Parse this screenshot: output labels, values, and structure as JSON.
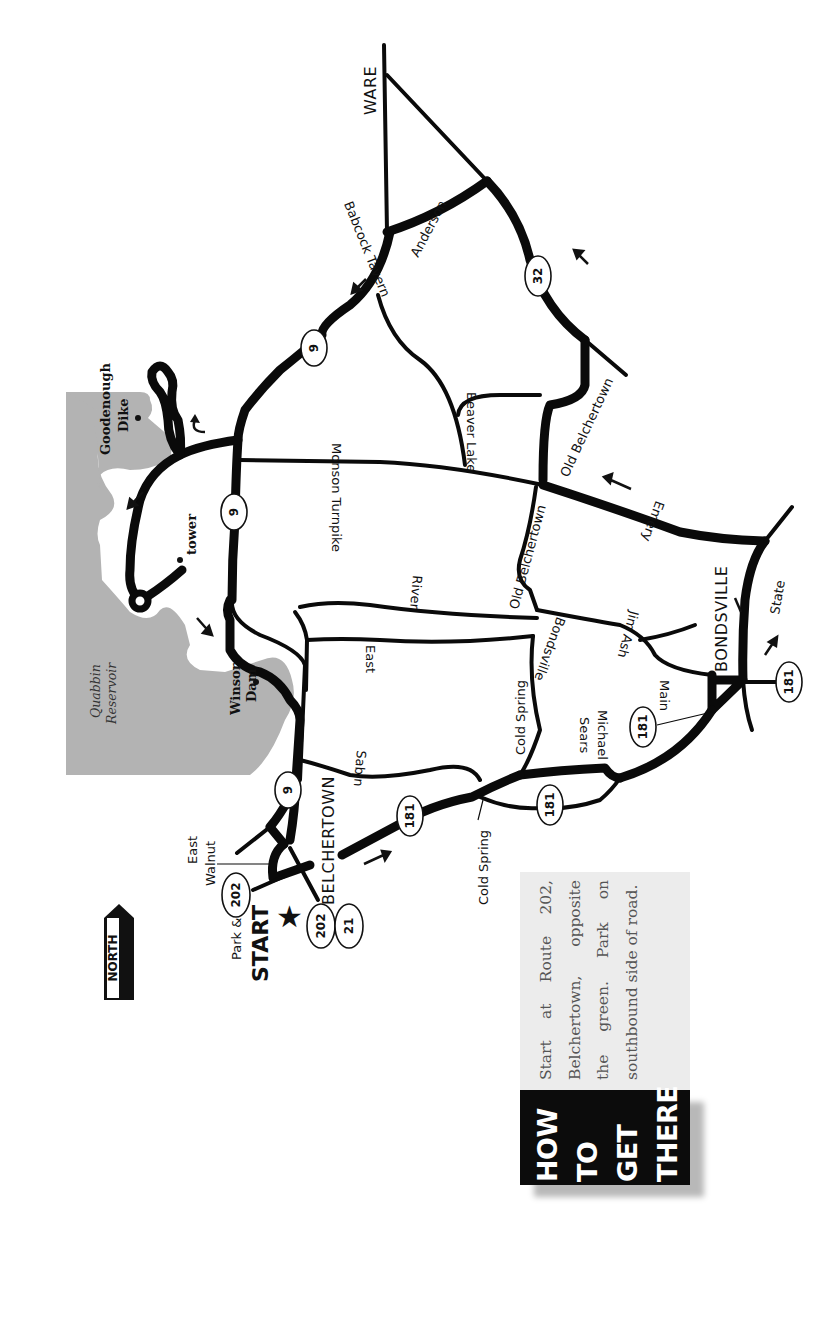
{
  "map": {
    "title": "How to get there route map",
    "north_label": "NORTH",
    "water": {
      "reservoir_label_line1": "Quabbin",
      "reservoir_label_line2": "Reservoir"
    },
    "landmarks": {
      "goodenough_line1": "Goodenough",
      "goodenough_line2": "Dike",
      "tower": "tower",
      "winsor_line1": "Winsor",
      "winsor_line2": "Dam"
    },
    "towns": {
      "ware": "WARE",
      "belchertown": "BELCHERTOWN",
      "bondsville": "BONDSVILLE"
    },
    "start": {
      "line1": "Park &",
      "line2": "START",
      "marker": "★"
    },
    "roads": {
      "anderson": "Anderson",
      "babcock_tavern": "Babcock Tavern",
      "beaver_lake": "Beaver Lake",
      "old_belchertown_1": "Old Belchertown",
      "old_belchertown_2": "Old Belchertown",
      "monson_turnpike": "Monson Turnpike",
      "emery": "Emery",
      "river": "River",
      "east": "East",
      "bondsville": "Bondsville",
      "jim_ash": "Jim Ash",
      "state": "State",
      "main": "Main",
      "cold_spring_road": "Cold Spring",
      "michael_sears_line1": "Michael",
      "michael_sears_line2": "Sears",
      "sabin": "Sabin",
      "east_walnut_line1": "East",
      "east_walnut_line2": "Walnut",
      "cold_spring_place": "Cold Spring"
    },
    "route_shields": {
      "r9_north": "9",
      "r9_center": "9",
      "r9_south": "9",
      "r32": "32",
      "r181_a": "181",
      "r181_b": "181",
      "r181_c": "181",
      "r181_d": "181",
      "r202_a": "202",
      "r202_b": "202",
      "r21": "21"
    }
  },
  "how_to_get_there": {
    "heading": [
      "HOW",
      "TO",
      "GET",
      "THERE"
    ],
    "directions": "Start at Route 202, Belchertown, opposite the green. Park on southbound side of road."
  },
  "colors": {
    "road": "#0a0a0a",
    "water": "#b3b3b3",
    "panel_text_bg": "#ececec",
    "panel_head_bg": "#0c0c0c"
  }
}
